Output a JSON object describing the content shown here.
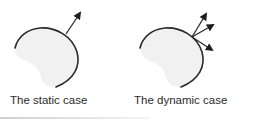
{
  "figure": {
    "panels": [
      {
        "id": "static",
        "caption": "The static case",
        "arrow_count": 1,
        "shape": "partially outlined blob with gray fill"
      },
      {
        "id": "dynamic",
        "caption": "The dynamic case",
        "arrow_count": 3,
        "shape": "partially outlined blob with gray fill"
      }
    ]
  },
  "colors": {
    "outline": "#2a2a2a",
    "fill": "#f1f1f1",
    "text": "#2b2b2b",
    "background": "#ffffff"
  }
}
